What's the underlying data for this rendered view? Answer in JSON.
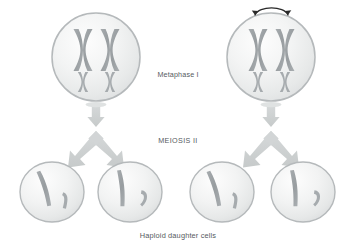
{
  "figure": {
    "title_text": "",
    "background_color": "#ffffff",
    "labels": {
      "metaphase": "Metaphase I",
      "meiosis": "MEIOSIS II",
      "haploid": "Haploid daughter cells"
    },
    "palette": {
      "cell_fill_light": "#fbfbfb",
      "cell_fill_mid": "#eceded",
      "cell_fill_edge": "#dcdedf",
      "cell_stroke": "#b5b9bb",
      "chromosome_fill": "#9a9fa2",
      "chromosome_small_fill": "#a8acaf",
      "arrow_fill": "#cfd2d3",
      "curved_arrow_stroke": "#2a2a2a",
      "text_color": "#555a5e"
    },
    "parent_cells": [
      {
        "name": "parent-cell-left",
        "cx": 96,
        "cy": 57,
        "r": 44,
        "has_rotation_arrow": false,
        "large_chromosomes": 2,
        "small_chromosomes": 2
      },
      {
        "name": "parent-cell-right",
        "cx": 271,
        "cy": 57,
        "r": 44,
        "has_rotation_arrow": true,
        "large_chromosomes": 2,
        "small_chromosomes": 2
      }
    ],
    "rotation_arrow": {
      "label": "chromosome-reorientation",
      "double_headed": true
    },
    "daughter_cells": [
      {
        "name": "daughter-cell-1",
        "cx": 52,
        "cy": 192,
        "rx": 32,
        "ry": 30,
        "small_chromatid_style": "hook-left"
      },
      {
        "name": "daughter-cell-2",
        "cx": 130,
        "cy": 192,
        "rx": 32,
        "ry": 30,
        "small_chromatid_style": "comma"
      },
      {
        "name": "daughter-cell-3",
        "cx": 222,
        "cy": 192,
        "rx": 32,
        "ry": 30,
        "small_chromatid_style": "hook-left"
      },
      {
        "name": "daughter-cell-4",
        "cx": 303,
        "cy": 192,
        "rx": 32,
        "ry": 30,
        "small_chromatid_style": "comma"
      }
    ],
    "arrow_groups": [
      {
        "name": "meiosis-arrow-left",
        "stem_x": 96,
        "split_left_x": 52,
        "split_right_x": 130
      },
      {
        "name": "meiosis-arrow-right",
        "stem_x": 271,
        "split_left_x": 222,
        "split_right_x": 303
      }
    ],
    "label_positions": {
      "metaphase": {
        "x": 178,
        "y": 77
      },
      "meiosis": {
        "x": 178,
        "y": 143
      },
      "haploid": {
        "x": 178,
        "y": 238
      }
    }
  }
}
